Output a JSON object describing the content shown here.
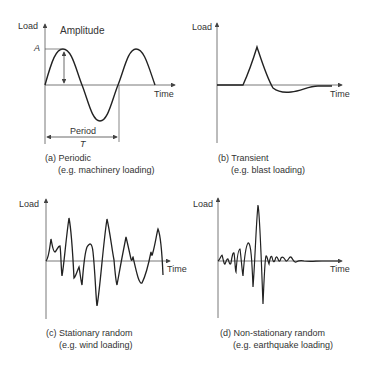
{
  "axes_labels": {
    "y": "Load",
    "x": "Time"
  },
  "panels": [
    {
      "id": "a",
      "caption_line1": "(a) Periodic",
      "caption_line2": "(e.g. machinery loading)",
      "annotations": {
        "amplitude": "Amplitude",
        "A": "A",
        "period": "Period",
        "T": "T"
      }
    },
    {
      "id": "b",
      "caption_line1": "(b) Transient",
      "caption_line2": "(e.g. blast loading)"
    },
    {
      "id": "c",
      "caption_line1": "(c) Stationary random",
      "caption_line2": "(e.g. wind loading)"
    },
    {
      "id": "d",
      "caption_line1": "(d) Non-stationary random",
      "caption_line2": "(e.g. earthquake loading)"
    }
  ],
  "colors": {
    "axis": "#555555",
    "curve": "#222222",
    "text": "#333333"
  }
}
